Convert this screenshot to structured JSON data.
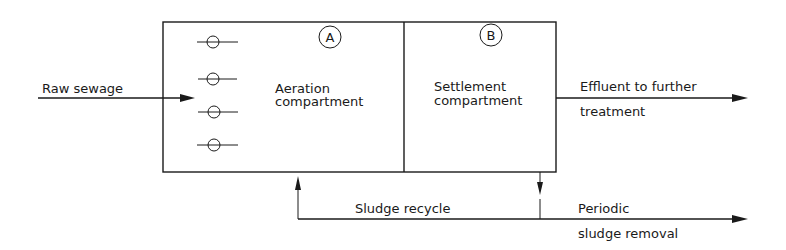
{
  "diagram": {
    "inputs": {
      "raw_sewage": "Raw sewage"
    },
    "compartments": [
      {
        "marker": "A",
        "label_line1": "Aeration",
        "label_line2": "compartment"
      },
      {
        "marker": "B",
        "label_line1": "Settlement",
        "label_line2": "compartment"
      }
    ],
    "outputs": {
      "effluent_line1": "Effluent to further",
      "effluent_line2": "treatment",
      "removal_line1": "Periodic",
      "removal_line2": "sludge removal"
    },
    "recycle": {
      "label": "Sludge recycle"
    },
    "diffusers": {
      "count": 4,
      "icon": "air-diffuser-icon"
    }
  }
}
